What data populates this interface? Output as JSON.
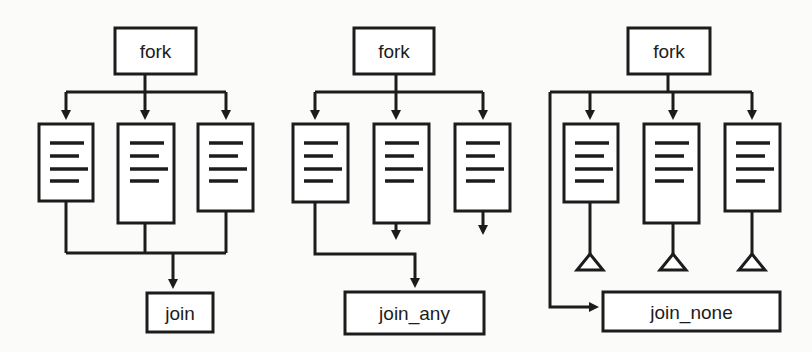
{
  "diagram": {
    "type": "fork-join-variants",
    "colors": {
      "background": "#fbfbfa",
      "stroke": "#1c1c1c",
      "box_fill": "#ffffff"
    },
    "panels": [
      {
        "id": "join",
        "fork_label": "fork",
        "join_label": "join",
        "processes": 3,
        "behavior": "all processes converge into join"
      },
      {
        "id": "join_any",
        "fork_label": "fork",
        "join_label": "join_any",
        "processes": 3,
        "behavior": "first process connects to join_any; other processes continue with open arrows"
      },
      {
        "id": "join_none",
        "fork_label": "fork",
        "join_label": "join_none",
        "processes": 3,
        "behavior": "fork bypasses directly to join_none; processes terminate in triangles"
      }
    ]
  }
}
